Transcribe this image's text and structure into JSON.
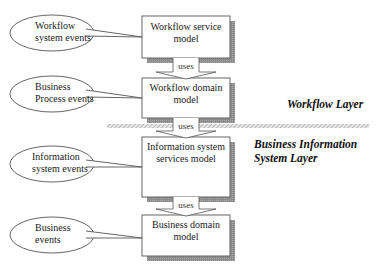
{
  "models": [
    {
      "label_lines": [
        "Workflow service",
        "model"
      ]
    },
    {
      "label_lines": [
        "Workflow domain",
        "model"
      ]
    },
    {
      "label_lines": [
        "Information system",
        "services model"
      ]
    },
    {
      "label_lines": [
        "Business domain",
        "model"
      ]
    }
  ],
  "events": [
    {
      "label_lines": [
        "Workflow",
        "system events"
      ]
    },
    {
      "label_lines": [
        "Business",
        "Process events"
      ]
    },
    {
      "label_lines": [
        "Information",
        "system events"
      ]
    },
    {
      "label_lines": [
        "Business",
        "events"
      ]
    }
  ],
  "connectors": [
    {
      "label": "uses"
    },
    {
      "label": "uses"
    },
    {
      "label": "uses"
    }
  ],
  "layers": {
    "upper": {
      "label_lines": [
        "Workflow Layer"
      ]
    },
    "lower": {
      "label_lines": [
        "Business Information",
        "System Layer"
      ]
    }
  },
  "colors": {
    "line": "#555555",
    "shadow": "#8a8a8a",
    "hatch": "#9a9a9a",
    "text": "#222222"
  }
}
